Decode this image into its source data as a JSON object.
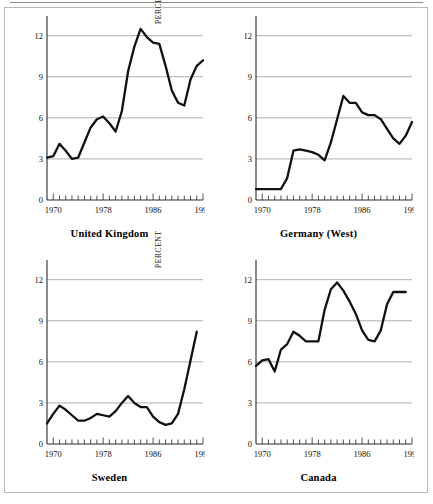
{
  "figure": {
    "ylabel": "PERCENT",
    "y_ticks": [
      "0",
      "3",
      "6",
      "9",
      "12"
    ],
    "x_ticks": [
      "1970",
      "1978",
      "1986",
      "1994"
    ],
    "panel_titles": [
      "United Kingdom",
      "Germany (West)",
      "Sweden",
      "Canada"
    ]
  },
  "chart_data": [
    {
      "type": "line",
      "title": "United Kingdom",
      "xlabel": "",
      "ylabel": "PERCENT",
      "xlim": [
        1969,
        1994
      ],
      "ylim": [
        0,
        13
      ],
      "ytick_values": [
        0,
        3,
        6,
        9,
        12
      ],
      "xtick_values": [
        1970,
        1978,
        1986,
        1994
      ],
      "grid": "horizontal",
      "legend": "none",
      "x": [
        1969,
        1970,
        1971,
        1972,
        1973,
        1974,
        1975,
        1976,
        1977,
        1978,
        1979,
        1980,
        1981,
        1982,
        1983,
        1984,
        1985,
        1986,
        1987,
        1988,
        1989,
        1990,
        1991,
        1992,
        1993,
        1994
      ],
      "values": [
        3.1,
        3.2,
        4.1,
        3.6,
        3.0,
        3.1,
        4.2,
        5.3,
        5.9,
        6.1,
        5.6,
        5.0,
        6.5,
        9.4,
        11.2,
        12.5,
        11.9,
        11.5,
        11.4,
        9.8,
        8.0,
        7.1,
        6.9,
        8.8,
        9.8,
        10.2
      ],
      "color": "#111111"
    },
    {
      "type": "line",
      "title": "Germany (West)",
      "xlabel": "",
      "ylabel": "PERCENT",
      "xlim": [
        1969,
        1994
      ],
      "ylim": [
        0,
        13
      ],
      "ytick_values": [
        0,
        3,
        6,
        9,
        12
      ],
      "xtick_values": [
        1970,
        1978,
        1986,
        1994
      ],
      "grid": "horizontal",
      "legend": "none",
      "x": [
        1969,
        1970,
        1971,
        1972,
        1973,
        1974,
        1975,
        1976,
        1977,
        1978,
        1979,
        1980,
        1981,
        1982,
        1983,
        1984,
        1985,
        1986,
        1987,
        1988,
        1989,
        1990,
        1991,
        1992,
        1993,
        1994
      ],
      "values": [
        0.8,
        0.8,
        0.8,
        0.8,
        0.8,
        1.6,
        3.6,
        3.7,
        3.6,
        3.5,
        3.3,
        2.9,
        4.2,
        5.9,
        7.6,
        7.1,
        7.1,
        6.4,
        6.2,
        6.2,
        5.9,
        5.2,
        4.5,
        4.1,
        4.7,
        5.7
      ],
      "color": "#111111"
    },
    {
      "type": "line",
      "title": "Sweden",
      "xlabel": "",
      "ylabel": "PERCENT",
      "xlim": [
        1969,
        1994
      ],
      "ylim": [
        0,
        13
      ],
      "ytick_values": [
        0,
        3,
        6,
        9,
        12
      ],
      "xtick_values": [
        1970,
        1978,
        1986,
        1994
      ],
      "grid": "horizontal",
      "legend": "none",
      "x": [
        1969,
        1970,
        1971,
        1972,
        1973,
        1974,
        1975,
        1976,
        1977,
        1978,
        1979,
        1980,
        1981,
        1982,
        1983,
        1984,
        1985,
        1986,
        1987,
        1988,
        1989,
        1990,
        1991,
        1992,
        1993
      ],
      "values": [
        1.5,
        2.2,
        2.8,
        2.5,
        2.1,
        1.7,
        1.7,
        1.9,
        2.2,
        2.1,
        2.0,
        2.4,
        3.0,
        3.5,
        3.0,
        2.7,
        2.7,
        2.0,
        1.6,
        1.4,
        1.5,
        2.2,
        4.0,
        6.1,
        8.2
      ],
      "color": "#111111"
    },
    {
      "type": "line",
      "title": "Canada",
      "xlabel": "",
      "ylabel": "PERCENT",
      "xlim": [
        1969,
        1994
      ],
      "ylim": [
        0,
        13
      ],
      "ytick_values": [
        0,
        3,
        6,
        9,
        12
      ],
      "xtick_values": [
        1970,
        1978,
        1986,
        1994
      ],
      "grid": "horizontal",
      "legend": "none",
      "x": [
        1969,
        1970,
        1971,
        1972,
        1973,
        1974,
        1975,
        1976,
        1977,
        1978,
        1979,
        1980,
        1981,
        1982,
        1983,
        1984,
        1985,
        1986,
        1987,
        1988,
        1989,
        1990,
        1991,
        1992,
        1993
      ],
      "values": [
        5.7,
        6.1,
        6.2,
        5.3,
        6.9,
        7.3,
        8.2,
        7.9,
        7.5,
        7.5,
        7.5,
        9.8,
        11.3,
        11.8,
        11.2,
        10.4,
        9.5,
        8.3,
        7.6,
        7.5,
        8.3,
        10.2,
        11.1,
        11.1,
        11.1
      ],
      "color": "#111111"
    }
  ]
}
